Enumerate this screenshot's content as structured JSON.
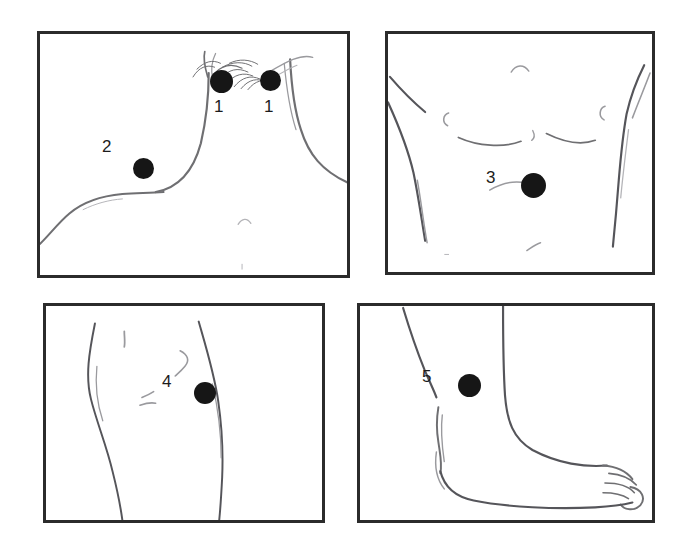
{
  "figure": {
    "kind": "medical-illustration-panel-grid",
    "background_color": "#ffffff",
    "panel_border_color": "#2b2b2b",
    "marker_color": "#161616",
    "label_color": "#1c1c1c",
    "line_color": "#6f6f72",
    "panels": [
      {
        "id": "neck",
        "region_label": "neck-and-shoulders",
        "markers": [
          {
            "label": "1",
            "dot": {
              "x": 218,
              "y": 78,
              "d": 23
            },
            "text": {
              "x": 212,
              "y": 97
            }
          },
          {
            "label": "1",
            "dot": {
              "x": 267,
              "y": 77,
              "d": 21
            },
            "text": {
              "x": 262,
              "y": 97
            }
          },
          {
            "label": "2",
            "dot": {
              "x": 140,
              "y": 165,
              "d": 21
            },
            "text": {
              "x": 101,
              "y": 141
            }
          }
        ]
      },
      {
        "id": "abdomen",
        "region_label": "chest-and-abdomen",
        "markers": [
          {
            "label": "3",
            "dot": {
              "x": 531,
              "y": 182,
              "d": 25
            },
            "text": {
              "x": 496,
              "y": 174
            }
          }
        ]
      },
      {
        "id": "knee",
        "region_label": "knee-and-thigh",
        "markers": [
          {
            "label": "4",
            "dot": {
              "x": 202,
              "y": 390,
              "d": 22
            },
            "text": {
              "x": 170,
              "y": 381
            }
          }
        ]
      },
      {
        "id": "ankle",
        "region_label": "ankle-and-foot",
        "markers": [
          {
            "label": "5",
            "dot": {
              "x": 466,
              "y": 382,
              "d": 23
            },
            "text": {
              "x": 430,
              "y": 376
            }
          }
        ]
      }
    ]
  },
  "markers": {
    "m1a": "1",
    "m1b": "1",
    "m2": "2",
    "m3": "3",
    "m4": "4",
    "m5": "5"
  }
}
